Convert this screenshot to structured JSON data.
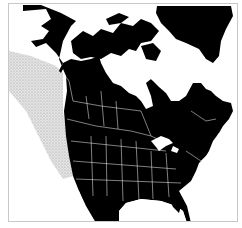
{
  "map": {
    "title": "North America range map",
    "region": "North America",
    "colors": {
      "land": "#000000",
      "water": "#ffffff",
      "borders": "#ffffff",
      "range": "#cfcfcf",
      "frame": "#c8c8c8"
    },
    "legend": {
      "range_label": "Range (stippled area)"
    }
  }
}
